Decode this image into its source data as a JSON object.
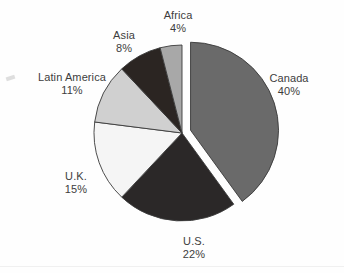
{
  "chart_data": {
    "type": "pie",
    "title": "",
    "subtitle": "",
    "xlabel": "",
    "ylabel": "",
    "legend_position": "none",
    "grid": false,
    "label_format": "name + percent",
    "start_angle_deg": 0,
    "direction": "clockwise",
    "categories": [
      "Canada",
      "U.S.",
      "U.K.",
      "Latin America",
      "Asia",
      "Africa"
    ],
    "values": [
      40,
      22,
      15,
      11,
      8,
      4
    ],
    "unit": "%",
    "slices": [
      {
        "name": "Canada",
        "value": 40,
        "value_label": "40%",
        "color": "#6a6a6a",
        "exploded": true,
        "label_x": 289,
        "label_y": 72
      },
      {
        "name": "U.S.",
        "value": 22,
        "value_label": "22%",
        "color": "#2b2828",
        "exploded": false,
        "label_x": 194,
        "label_y": 235
      },
      {
        "name": "U.K.",
        "value": 15,
        "value_label": "15%",
        "color": "#f5f5f5",
        "exploded": false,
        "label_x": 76,
        "label_y": 170
      },
      {
        "name": "Latin America",
        "value": 11,
        "value_label": "11%",
        "color": "#d0d0d0",
        "exploded": false,
        "label_x": 72,
        "label_y": 71
      },
      {
        "name": "Asia",
        "value": 8,
        "value_label": "8%",
        "color": "#2b2522",
        "exploded": false,
        "label_x": 124,
        "label_y": 29
      },
      {
        "name": "Africa",
        "value": 4,
        "value_label": "4%",
        "color": "#a8a8a8",
        "exploded": false,
        "label_x": 178,
        "label_y": 9
      }
    ],
    "geometry": {
      "center_x": 182,
      "center_y": 133,
      "radius": 88,
      "explode_offset": 9
    },
    "style": {
      "background": "#fefefe",
      "outline_color": "#3a3a3a",
      "label_color": "#3d3d3d"
    }
  }
}
